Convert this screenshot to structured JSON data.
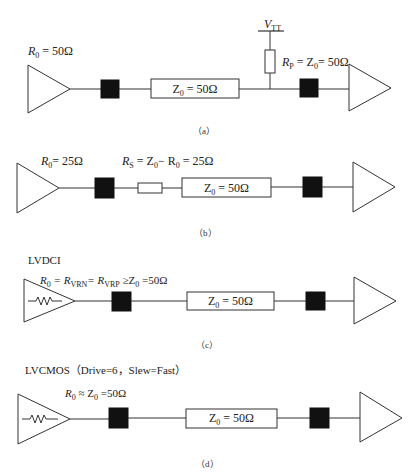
{
  "figure": {
    "panels": [
      {
        "id": "a",
        "caption": "（a）",
        "title": "",
        "driver_label": {
          "symbol": "R",
          "sub": "0",
          "rest": " = 50Ω"
        },
        "line_label": {
          "symbol": "Z",
          "sub": "0",
          "rest": " = 50Ω"
        },
        "termination": {
          "rail": {
            "symbol": "V",
            "sub": "TT"
          },
          "resistor_label": {
            "symbol": "R",
            "sub": "P",
            "mid": " = Z",
            "sub2": "0",
            "rest": "= 50Ω"
          }
        },
        "driver_type": "plain-buffer"
      },
      {
        "id": "b",
        "caption": "（b）",
        "title": "",
        "driver_label": {
          "symbol": "R",
          "sub": "0",
          "rest": "= 25Ω"
        },
        "series_label": {
          "symbol": "R",
          "sub": "S",
          "mid": " = Z",
          "sub2": "0",
          "mid2": "− R",
          "sub3": "0",
          "rest": " = 25Ω"
        },
        "line_label": {
          "symbol": "Z",
          "sub": "0",
          "rest": " = 50Ω"
        },
        "driver_type": "plain-buffer"
      },
      {
        "id": "c",
        "caption": "（c）",
        "title": "LVDCI",
        "driver_label": {
          "symbol": "R",
          "sub": "0",
          "mid": " = R",
          "sub2": "VRN",
          "mid2": "= R",
          "sub3": "VRP",
          "rest": "  ≥Z",
          "sub4": "0",
          "rest2": " =50Ω"
        },
        "line_label": {
          "symbol": "Z",
          "sub": "0",
          "rest": " = 50Ω"
        },
        "driver_type": "buffer-with-internal-resistor"
      },
      {
        "id": "d",
        "caption": "（d）",
        "title": "LVCMOS（Drive=6，Slew=Fast）",
        "driver_label": {
          "symbol": "R",
          "sub": "0",
          "mid": " ≈ Z",
          "sub2": "0",
          "rest": " =50Ω"
        },
        "line_label": {
          "symbol": "Z",
          "sub": "0",
          "rest": " = 50Ω"
        },
        "driver_type": "buffer-with-internal-resistor"
      }
    ],
    "icons": {
      "driver": "triangle-buffer-icon",
      "receiver": "triangle-buffer-icon",
      "package_pin": "black-square-icon",
      "resistor": "resistor-icon",
      "internal_resistor": "zigzag-resistor-icon",
      "rail": "vtt-rail-icon"
    },
    "colors": {
      "stroke": "#333333",
      "fill_pin": "#111111",
      "background": "#ffffff"
    }
  }
}
